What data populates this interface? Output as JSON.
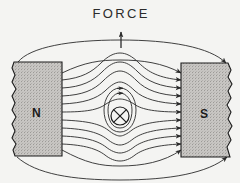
{
  "figure": {
    "background_color": "#f4f4f2",
    "ink_color": "#2b2b2b"
  },
  "force": {
    "label": "FORCE",
    "arrow_direction": "up",
    "arrow_icon": "arrow-up-icon"
  },
  "magnets": [
    {
      "id": "north",
      "letter": "N",
      "side": "left",
      "fill_color": "#c9c7c4",
      "edge_color": "#1c1c1c",
      "torn_edge": "left",
      "x": 14,
      "y": 62,
      "width": 48,
      "height": 94
    },
    {
      "id": "south",
      "letter": "S",
      "side": "right",
      "fill_color": "#c9c7c4",
      "edge_color": "#1c1c1c",
      "torn_edge": "right",
      "x": 181,
      "y": 63,
      "width": 51,
      "height": 94
    }
  ],
  "conductor": {
    "symbol": "current-into-page-icon",
    "description": "circle with cross",
    "center_x": 120,
    "center_y": 116,
    "radius": 9
  },
  "field": {
    "direction": "left-to-right",
    "arrowhead_icon": "arrowhead-icon",
    "line_color": "#2b2b2b",
    "description": "Magnetic flux lines run from the N pole to the S pole, crowding above the conductor and thinning below it."
  },
  "loops": {
    "count": 2,
    "description": "Concentric field loops encircling the conductor",
    "arrow_icon": "arrow-up-icon"
  }
}
